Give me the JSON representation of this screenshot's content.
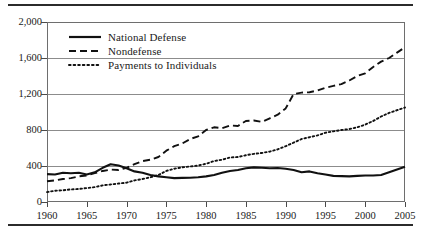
{
  "figure": {
    "has_top_rule": true,
    "has_bottom_rule": true
  },
  "legend": {
    "position": "inside-top-left",
    "items": [
      {
        "label": "National Defense",
        "style": "solid",
        "color": "#111111"
      },
      {
        "label": "Nondefense",
        "style": "dashed",
        "color": "#111111"
      },
      {
        "label": "Payments to Individuals",
        "style": "dotted",
        "color": "#111111"
      }
    ]
  },
  "chart_data": {
    "type": "line",
    "title": "",
    "subtitle": "",
    "xlabel": "",
    "ylabel": "",
    "xlim": [
      1960,
      2005
    ],
    "ylim": [
      0,
      2000
    ],
    "grid": true,
    "legend_position": "inside-top-left",
    "ytick_labels": [
      "0",
      "400",
      "800",
      "1,200",
      "1,600",
      "2,000"
    ],
    "ytick_values": [
      0,
      400,
      800,
      1200,
      1600,
      2000
    ],
    "xtick_labels": [
      "1960",
      "1965",
      "1970",
      "1975",
      "1980",
      "1985",
      "1990",
      "1995",
      "2000",
      "2005"
    ],
    "xtick_values": [
      1960,
      1965,
      1970,
      1975,
      1980,
      1985,
      1990,
      1995,
      2000,
      2005
    ],
    "x": [
      1960,
      1961,
      1962,
      1963,
      1964,
      1965,
      1966,
      1967,
      1968,
      1969,
      1970,
      1971,
      1972,
      1973,
      1974,
      1975,
      1976,
      1977,
      1978,
      1979,
      1980,
      1981,
      1982,
      1983,
      1984,
      1985,
      1986,
      1987,
      1988,
      1989,
      1990,
      1991,
      1992,
      1993,
      1994,
      1995,
      1996,
      1997,
      1998,
      1999,
      2000,
      2001,
      2002,
      2003,
      2004,
      2005
    ],
    "series": [
      {
        "name": "National Defense",
        "style": "solid",
        "color": "#111111",
        "values": [
          310,
          305,
          325,
          320,
          325,
          305,
          330,
          380,
          420,
          405,
          375,
          340,
          325,
          300,
          285,
          275,
          265,
          268,
          270,
          275,
          285,
          300,
          325,
          345,
          355,
          375,
          385,
          380,
          375,
          378,
          370,
          355,
          330,
          340,
          320,
          305,
          290,
          288,
          285,
          290,
          295,
          295,
          300,
          330,
          360,
          392
        ]
      },
      {
        "name": "Nondefense",
        "style": "dashed",
        "color": "#111111",
        "values": [
          230,
          240,
          255,
          265,
          285,
          295,
          320,
          345,
          360,
          355,
          380,
          420,
          455,
          470,
          500,
          570,
          620,
          650,
          700,
          730,
          800,
          830,
          820,
          850,
          845,
          900,
          905,
          890,
          930,
          970,
          1040,
          1200,
          1215,
          1220,
          1240,
          1270,
          1290,
          1310,
          1350,
          1400,
          1430,
          1500,
          1560,
          1600,
          1660,
          1720
        ]
      },
      {
        "name": "Payments to Individuals",
        "style": "dotted",
        "color": "#111111",
        "values": [
          110,
          125,
          130,
          140,
          145,
          155,
          165,
          185,
          195,
          205,
          215,
          240,
          255,
          275,
          300,
          345,
          370,
          385,
          395,
          405,
          425,
          455,
          470,
          495,
          500,
          520,
          535,
          545,
          560,
          585,
          620,
          660,
          700,
          720,
          740,
          770,
          785,
          800,
          810,
          830,
          860,
          900,
          950,
          990,
          1020,
          1050
        ]
      }
    ]
  }
}
